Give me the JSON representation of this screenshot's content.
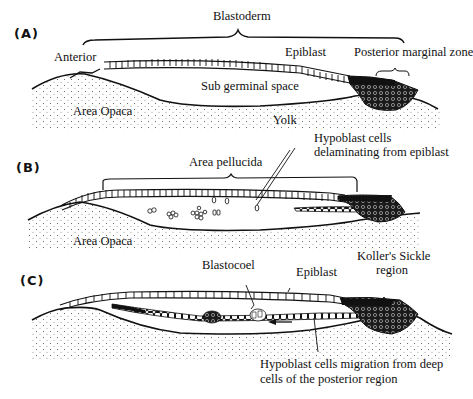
{
  "figure": {
    "panels": [
      {
        "tag": "(A)",
        "labels": {
          "blastoderm": "Blastoderm",
          "anterior": "Anterior",
          "epiblast": "Epiblast",
          "posterior_marginal_zone": "Posterior marginal zone",
          "sub_germinal_space": "Sub germinal space",
          "area_opaca": "Area Opaca",
          "yolk": "Yolk"
        }
      },
      {
        "tag": "(B)",
        "labels": {
          "area_pellucida": "Area pellucida",
          "hypoblast_line1": "Hypoblast cells",
          "hypoblast_line2": "delaminating from epiblast",
          "area_opaca": "Area Opaca"
        }
      },
      {
        "tag": "(C)",
        "labels": {
          "blastocoel": "Blastocoel",
          "epiblast": "Epiblast",
          "kollers_line1": "Koller's Sickle",
          "kollers_line2": "region",
          "migration_line1": "Hypoblast cells migration from deep",
          "migration_line2": "cells of the posterior region"
        }
      }
    ]
  }
}
